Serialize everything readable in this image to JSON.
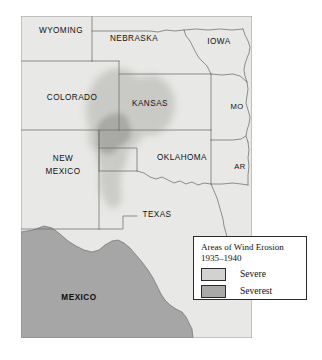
{
  "figure": {
    "kind": "thematic-map"
  },
  "map": {
    "background_color": "#ffffff",
    "land_fill": "#e8e8e6",
    "border_stroke": "#6d6d6d",
    "outer_stroke": "#8a8a8a",
    "mexico_fill": "#a6a6a6",
    "erosion_severe_fill": "#c9c9c7",
    "erosion_severest_fill": "#a9a9a7",
    "states": [
      {
        "id": "wyoming",
        "label": "WYOMING",
        "x": 61,
        "y": 31,
        "lines": [
          "WYOMING"
        ]
      },
      {
        "id": "nebraska",
        "label": "NEBRASKA",
        "x": 134,
        "y": 39,
        "lines": [
          "NEBRASKA"
        ]
      },
      {
        "id": "iowa",
        "label": "IOWA",
        "x": 219,
        "y": 42,
        "lines": [
          "IOWA"
        ]
      },
      {
        "id": "colorado",
        "label": "COLORADO",
        "x": 72,
        "y": 98,
        "lines": [
          "COLORADO"
        ]
      },
      {
        "id": "kansas",
        "label": "KANSAS",
        "x": 150,
        "y": 104,
        "lines": [
          "KANSAS"
        ]
      },
      {
        "id": "missouri",
        "label": "MO",
        "x": 237,
        "y": 107,
        "lines": [
          "MO"
        ]
      },
      {
        "id": "new-mexico",
        "label": "NEW MEXICO",
        "x": 63,
        "y": 165,
        "lines": [
          "NEW",
          "MEXICO"
        ]
      },
      {
        "id": "oklahoma",
        "label": "OKLAHOMA",
        "x": 182,
        "y": 158,
        "lines": [
          "OKLAHOMA"
        ]
      },
      {
        "id": "arkansas",
        "label": "AR",
        "x": 240,
        "y": 167,
        "lines": [
          "AR"
        ]
      },
      {
        "id": "texas",
        "label": "TEXAS",
        "x": 157,
        "y": 215,
        "lines": [
          "TEXAS"
        ]
      }
    ],
    "countries": [
      {
        "id": "mexico",
        "label": "MEXICO",
        "x": 79,
        "y": 298
      }
    ]
  },
  "legend": {
    "title_line1": "Areas of Wind Erosion",
    "title_line2": "1935–1940",
    "items": [
      {
        "id": "severe",
        "label": "Severe",
        "color": "#d2d2d0"
      },
      {
        "id": "severest",
        "label": "Severest",
        "color": "#a9a9a7"
      }
    ]
  }
}
